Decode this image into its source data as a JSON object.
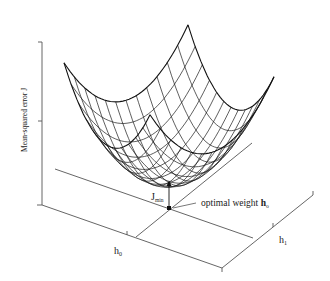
{
  "figure": {
    "y_axis_label": "Mean-squared error J",
    "x_axis_h0_label": "h",
    "x_axis_h0_subscript": "0",
    "x_axis_h1_label": "h",
    "x_axis_h1_subscript": "1",
    "jmin_label": "J",
    "jmin_subscript": "min",
    "optimal_label": "optimal weight ",
    "optimal_symbol": "h",
    "optimal_subscript": "o"
  },
  "colors": {
    "background": "#ffffff",
    "lines": "#222222",
    "axes": "#555555"
  },
  "surface": {
    "type": "quadratic-bowl-mesh",
    "grid_lines_per_direction": 13
  }
}
